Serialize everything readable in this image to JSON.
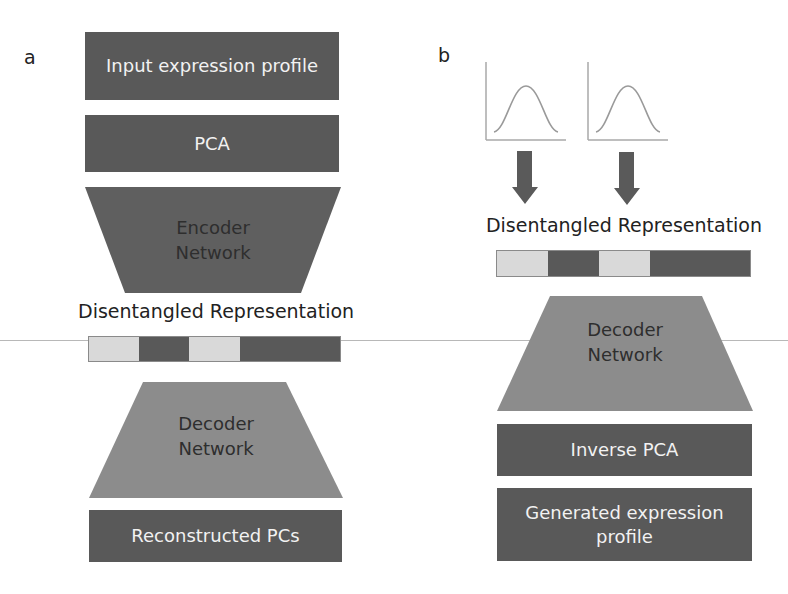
{
  "panels": {
    "a": {
      "label": "a",
      "input_box": "Input expression profile",
      "pca_box": "PCA",
      "encoder": {
        "line1": "Encoder",
        "line2": "Network"
      },
      "representation_label": "Disentangled Representation",
      "representation_segments": [
        "light",
        "dark",
        "light",
        "dark"
      ],
      "decoder": {
        "line1": "Decoder",
        "line2": "Network"
      },
      "output_box": "Reconstructed PCs"
    },
    "b": {
      "label": "b",
      "distribution_plots": [
        {
          "name": "gaussian-prior-1",
          "shape": "bell-curve"
        },
        {
          "name": "gaussian-prior-2",
          "shape": "bell-curve"
        }
      ],
      "arrows": [
        "down-arrow",
        "down-arrow"
      ],
      "representation_label": "Disentangled Representation",
      "representation_segments": [
        "light",
        "dark",
        "light",
        "dark"
      ],
      "decoder": {
        "line1": "Decoder",
        "line2": "Network"
      },
      "inverse_pca_box": "Inverse PCA",
      "output_box": {
        "line1": "Generated expression",
        "line2": "profile"
      }
    }
  },
  "colors": {
    "dark_box": "#595959",
    "encoder_fill": "#5f5f5f",
    "decoder_fill": "#8c8c8c",
    "light_segment": "#d9d9d9",
    "curve": "#9a9a9a",
    "arrow": "#5a5a5a"
  }
}
